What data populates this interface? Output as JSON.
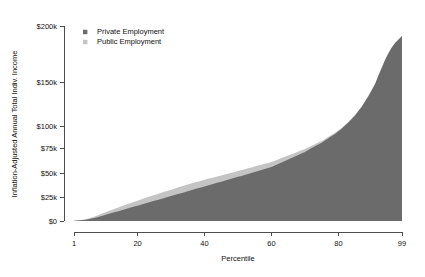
{
  "chart_data": {
    "type": "area",
    "title": "",
    "subtitle": "",
    "xlabel": "Percentile",
    "ylabel": "Inflation-Adjusted Annual Total Indiv. Income",
    "stacked": true,
    "grid": false,
    "legend_position": "top-left",
    "xlim": [
      1,
      99
    ],
    "ylim": [
      0,
      200000
    ],
    "y_scale": "compressed",
    "xticks": [
      1,
      20,
      40,
      60,
      80,
      99
    ],
    "xticklabels": [
      "1",
      "20",
      "40",
      "60",
      "80",
      "99"
    ],
    "yticks": [
      0,
      25000,
      50000,
      75000,
      100000,
      150000,
      200000
    ],
    "yticklabels": [
      "$0",
      "$25k",
      "$50k",
      "$75k",
      "$100k",
      "$150k",
      "$200k"
    ],
    "x": [
      1,
      2,
      3,
      4,
      5,
      6,
      7,
      8,
      9,
      10,
      11,
      12,
      13,
      14,
      15,
      16,
      17,
      18,
      19,
      20,
      21,
      22,
      23,
      24,
      25,
      26,
      27,
      28,
      29,
      30,
      31,
      32,
      33,
      34,
      35,
      36,
      37,
      38,
      39,
      40,
      41,
      42,
      43,
      44,
      45,
      46,
      47,
      48,
      49,
      50,
      51,
      52,
      53,
      54,
      55,
      56,
      57,
      58,
      59,
      60,
      61,
      62,
      63,
      64,
      65,
      66,
      67,
      68,
      69,
      70,
      71,
      72,
      73,
      74,
      75,
      76,
      77,
      78,
      79,
      80,
      81,
      82,
      83,
      84,
      85,
      86,
      87,
      88,
      89,
      90,
      91,
      92,
      93,
      94,
      95,
      96,
      97,
      98,
      99
    ],
    "series": [
      {
        "name": "Private Employment",
        "color": "#6b6b6b",
        "values": [
          200,
          400,
          700,
          1100,
          1600,
          2300,
          3100,
          4000,
          5000,
          6000,
          7000,
          8000,
          9000,
          10000,
          11000,
          12000,
          13000,
          14000,
          15000,
          16000,
          17000,
          18000,
          19000,
          20000,
          21000,
          22000,
          23000,
          24000,
          25000,
          26000,
          27000,
          28000,
          29000,
          30000,
          31000,
          32000,
          33000,
          34000,
          35000,
          36000,
          37000,
          38000,
          39000,
          40000,
          41000,
          42000,
          43000,
          44000,
          45000,
          46000,
          47000,
          48000,
          49000,
          50000,
          51000,
          52000,
          53000,
          54000,
          55000,
          56000,
          57500,
          59000,
          60500,
          62000,
          63500,
          65000,
          66500,
          68000,
          69500,
          71000,
          73000,
          75000,
          77000,
          79000,
          81000,
          83500,
          86000,
          88500,
          91000,
          94000,
          97000,
          100500,
          104000,
          108000,
          112000,
          117000,
          122000,
          128000,
          134000,
          141000,
          148000,
          156000,
          163000,
          170000,
          176000,
          181000,
          185000,
          188000,
          191000
        ]
      },
      {
        "name": "Public Employment",
        "color": "#c4c4c4",
        "values": [
          100,
          200,
          350,
          550,
          800,
          1100,
          1450,
          1800,
          2200,
          2600,
          3000,
          3300,
          3600,
          3900,
          4200,
          4400,
          4600,
          4800,
          5000,
          5200,
          5400,
          5600,
          5800,
          6000,
          6100,
          6200,
          6300,
          6400,
          6500,
          6600,
          6700,
          6800,
          6900,
          7000,
          7000,
          7000,
          7000,
          7000,
          7000,
          7000,
          6900,
          6800,
          6700,
          6600,
          6500,
          6400,
          6300,
          6200,
          6100,
          6000,
          5900,
          5800,
          5700,
          5600,
          5500,
          5400,
          5300,
          5200,
          5100,
          5000,
          4800,
          4600,
          4400,
          4200,
          4000,
          3800,
          3600,
          3400,
          3200,
          3000,
          2800,
          2600,
          2400,
          2200,
          2000,
          1850,
          1700,
          1550,
          1400,
          1250,
          1100,
          1000,
          900,
          800,
          700,
          620,
          540,
          470,
          400,
          340,
          290,
          240,
          200,
          160,
          130,
          100,
          80,
          60,
          40
        ]
      }
    ]
  },
  "legend": {
    "items": [
      {
        "label": "Private Employment",
        "color": "#6b6b6b"
      },
      {
        "label": "Public Employment",
        "color": "#c4c4c4"
      }
    ]
  },
  "axes": {
    "y_title": "Inflation-Adjusted Annual Total Indiv. Income",
    "x_title": "Percentile"
  }
}
